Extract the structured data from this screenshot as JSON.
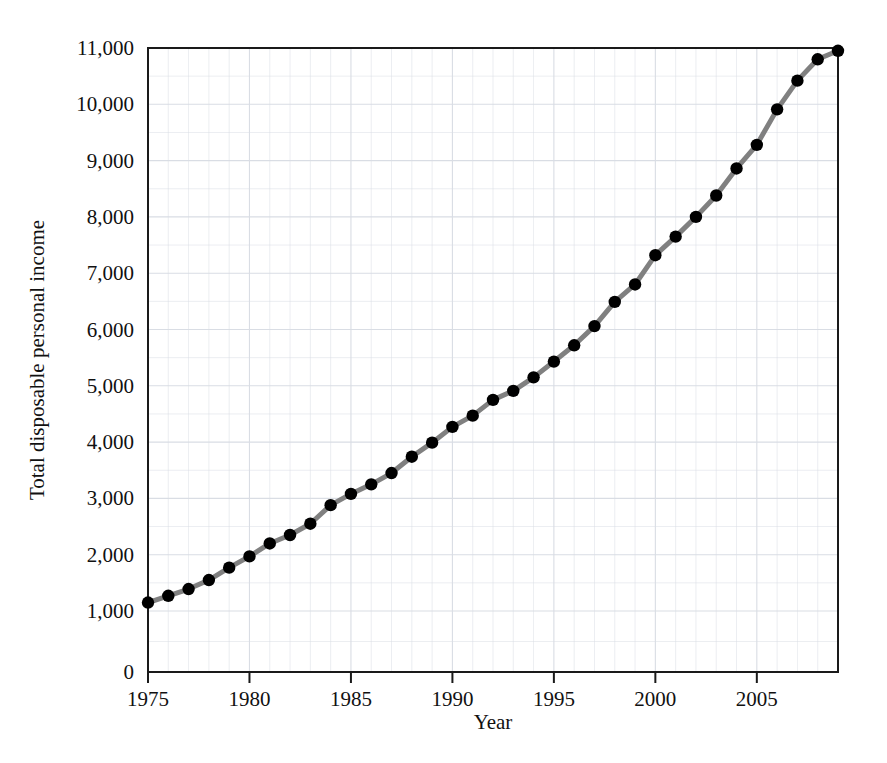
{
  "chart_data": {
    "type": "line",
    "title": "",
    "xlabel": "Year",
    "ylabel": "Total disposable personal income",
    "xlim": [
      1975,
      2009
    ],
    "ylim": [
      0,
      11000
    ],
    "grid": true,
    "legend": null,
    "y_axis_break": true,
    "y_break_note": "Axis compressed between 0 and 1,000",
    "x_major_ticks": [
      1975,
      1980,
      1985,
      1990,
      1995,
      2000,
      2005
    ],
    "x_tick_labels": [
      "1975",
      "1980",
      "1985",
      "1990",
      "1995",
      "2000",
      "2005"
    ],
    "x_minor_tick_step": 1,
    "y_ticks": [
      0,
      1000,
      2000,
      3000,
      4000,
      5000,
      6000,
      7000,
      8000,
      9000,
      10000,
      11000
    ],
    "y_tick_labels": [
      "0",
      "1,000",
      "2,000",
      "3,000",
      "4,000",
      "5,000",
      "6,000",
      "7,000",
      "8,000",
      "9,000",
      "10,000",
      "11,000"
    ],
    "y_minor_gridline_step": 500,
    "line_color": "#808080",
    "marker_color": "#000000",
    "frame_color": "#1a1a1a",
    "grid_color": "#d9dde4",
    "x": [
      1975,
      1976,
      1977,
      1978,
      1979,
      1980,
      1981,
      1982,
      1983,
      1984,
      1985,
      1986,
      1987,
      1988,
      1989,
      1990,
      1991,
      1992,
      1993,
      1994,
      1995,
      1996,
      1997,
      1998,
      1999,
      2000,
      2001,
      2002,
      2003,
      2004,
      2005,
      2006,
      2007,
      2008,
      2009
    ],
    "values": [
      1150,
      1270,
      1390,
      1550,
      1770,
      1970,
      2200,
      2350,
      2550,
      2880,
      3080,
      3250,
      3450,
      3740,
      3990,
      4270,
      4470,
      4750,
      4910,
      5150,
      5430,
      5720,
      6060,
      6490,
      6800,
      7320,
      7650,
      8000,
      8380,
      8860,
      9280,
      9910,
      10420,
      10800,
      10950
    ]
  }
}
